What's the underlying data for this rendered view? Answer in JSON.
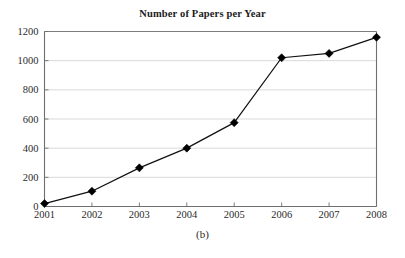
{
  "chart_data": {
    "type": "line",
    "title": "Number of Papers per Year",
    "caption": "(b)",
    "xlabel": "",
    "ylabel": "",
    "categories": [
      "2001",
      "2002",
      "2003",
      "2004",
      "2005",
      "2006",
      "2007",
      "2008"
    ],
    "values": [
      20,
      105,
      265,
      400,
      575,
      1020,
      1050,
      1160
    ],
    "series": [
      {
        "name": "Number of Papers",
        "values": [
          20,
          105,
          265,
          400,
          575,
          1020,
          1050,
          1160
        ]
      }
    ],
    "xlim": [
      2001,
      2008
    ],
    "ylim": [
      0,
      1200
    ],
    "ytick_labels": [
      "0",
      "200",
      "400",
      "600",
      "800",
      "1000",
      "1200"
    ],
    "ytick_values": [
      0,
      200,
      400,
      600,
      800,
      1000,
      1200
    ],
    "xtick_labels": [
      "2001",
      "2002",
      "2003",
      "2004",
      "2005",
      "2006",
      "2007",
      "2008"
    ],
    "grid": "horizontal",
    "legend": "none",
    "marker": "diamond",
    "line_color": "#111111",
    "marker_color": "#000000",
    "grid_color": "#c9c9c9",
    "axis_color": "#6e6e6e",
    "background_color": "#ffffff"
  }
}
